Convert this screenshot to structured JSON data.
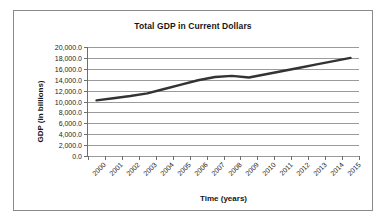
{
  "chart_data": {
    "type": "line",
    "title": "Total GDP in Current Dollars",
    "xlabel": "Time (years)",
    "ylabel": "GDP (in billions)",
    "categories": [
      "2000",
      "2001",
      "2002",
      "2003",
      "2004",
      "2005",
      "2006",
      "2007",
      "2008",
      "2009",
      "2010",
      "2011",
      "2012",
      "2013",
      "2014",
      "2015"
    ],
    "series": [
      {
        "name": "Total GDP",
        "color": "#333333",
        "values": [
          10200.0,
          10600.0,
          11000.0,
          11500.0,
          12300.0,
          13100.0,
          13900.0,
          14500.0,
          14700.0,
          14400.0,
          15000.0,
          15600.0,
          16200.0,
          16800.0,
          17400.0,
          18000.0
        ]
      }
    ],
    "ylim": [
      0,
      20000
    ],
    "ytick_values": [
      0,
      2000,
      4000,
      6000,
      8000,
      10000,
      12000,
      14000,
      16000,
      18000,
      20000
    ],
    "ytick_labels": [
      "0.0",
      "2,000.0",
      "4,000.0",
      "6,000.0",
      "8,000.0",
      "10,000.0",
      "12,000.0",
      "14,000.0",
      "16,000.0",
      "18,000.0",
      "20,000.0"
    ],
    "grid": "horizontal",
    "legend": "none",
    "xlabel_rotation": -45
  },
  "frame": {
    "border_color": "#8a8a8a",
    "background": "#ffffff"
  }
}
